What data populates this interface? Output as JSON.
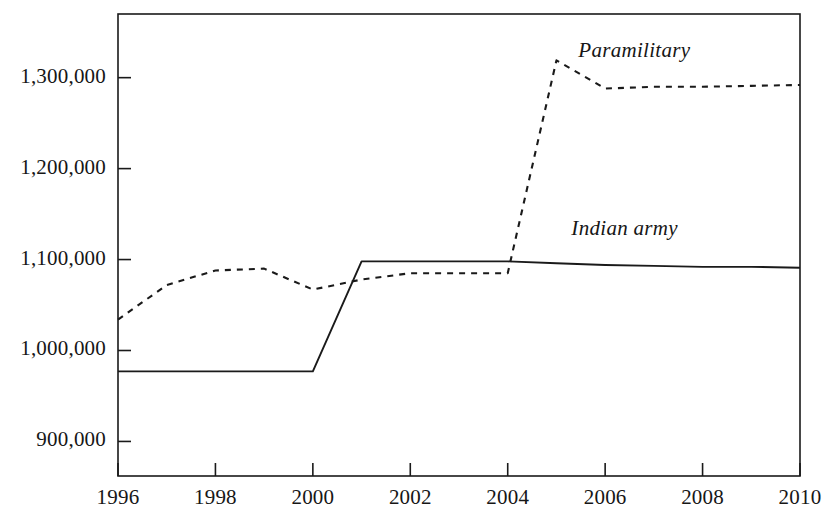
{
  "chart_data": {
    "type": "line",
    "title": "",
    "subtitle": "",
    "xlabel": "",
    "ylabel": "",
    "xlim": [
      1996,
      2010
    ],
    "ylim": [
      862000,
      1370000
    ],
    "grid": false,
    "legend_position": "inline-right",
    "x_ticks": [
      "1996",
      "1998",
      "2000",
      "2002",
      "2004",
      "2006",
      "2008",
      "2010"
    ],
    "x_tick_values": [
      1996,
      1998,
      2000,
      2002,
      2004,
      2006,
      2008,
      2010
    ],
    "y_ticks": [
      "900,000",
      "1,000,000",
      "1,100,000",
      "1,200,000",
      "1,300,000"
    ],
    "y_tick_values": [
      900000,
      1000000,
      1100000,
      1200000,
      1300000
    ],
    "x": [
      1996,
      1997,
      1998,
      1999,
      2000,
      2001,
      2002,
      2003,
      2004,
      2005,
      2006,
      2007,
      2008,
      2009,
      2010
    ],
    "series": [
      {
        "name": "Paramilitary",
        "style": "dashed",
        "color": "#1a1a1a",
        "values": [
          1034000,
          1072000,
          1088000,
          1090000,
          1067000,
          1078000,
          1085000,
          1085000,
          1085000,
          1319000,
          1288000,
          1290000,
          1290000,
          1291000,
          1292000
        ]
      },
      {
        "name": "Indian army",
        "style": "solid",
        "color": "#1a1a1a",
        "values": [
          977000,
          977000,
          977000,
          977000,
          977000,
          1098000,
          1098000,
          1098000,
          1098000,
          1096000,
          1094000,
          1093000,
          1092000,
          1092000,
          1091000
        ]
      }
    ],
    "annotations": [
      {
        "text": "Paramilitary",
        "x": 2006.6,
        "y": 1328000
      },
      {
        "text": "Indian army",
        "x": 2006.4,
        "y": 1133000
      }
    ]
  }
}
